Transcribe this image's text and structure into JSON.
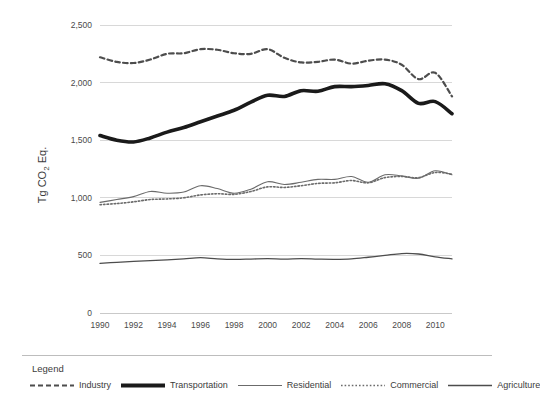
{
  "chart_data": {
    "type": "line",
    "title": "",
    "xlabel": "",
    "ylabel": "Tg CO",
    "ylabel_sub": "2",
    "ylabel_tail": " Eq.",
    "grid": true,
    "legend_position": "bottom",
    "xlim": [
      1990,
      2011
    ],
    "ylim": [
      0,
      2500
    ],
    "yticks": [
      0,
      500,
      1000,
      1500,
      2000,
      2500
    ],
    "ytick_labels": [
      "0",
      "500",
      "1,000",
      "1,500",
      "2,000",
      "2,500"
    ],
    "xticks": [
      1990,
      1992,
      1994,
      1996,
      1998,
      2000,
      2002,
      2004,
      2006,
      2008,
      2010
    ],
    "xtick_labels": [
      "1990",
      "1992",
      "1994",
      "1996",
      "1998",
      "2000",
      "2002",
      "2004",
      "2006",
      "2008",
      "2010"
    ],
    "x": [
      1990,
      1991,
      1992,
      1993,
      1994,
      1995,
      1996,
      1997,
      1998,
      1999,
      2000,
      2001,
      2002,
      2003,
      2004,
      2005,
      2006,
      2007,
      2008,
      2009,
      2010,
      2011
    ],
    "series": [
      {
        "name": "Industry",
        "style": "dashed",
        "color": "#4d4d4d",
        "width": 2.2,
        "values": [
          2220,
          2180,
          2170,
          2200,
          2250,
          2255,
          2290,
          2285,
          2255,
          2250,
          2290,
          2215,
          2175,
          2180,
          2200,
          2165,
          2190,
          2200,
          2155,
          2030,
          2085,
          1880
        ]
      },
      {
        "name": "Transportation",
        "style": "solid",
        "color": "#1a1a1a",
        "width": 3.6,
        "values": [
          1540,
          1500,
          1485,
          1520,
          1570,
          1610,
          1660,
          1710,
          1760,
          1830,
          1890,
          1880,
          1930,
          1925,
          1965,
          1965,
          1975,
          1990,
          1930,
          1820,
          1835,
          1730
        ]
      },
      {
        "name": "Residential",
        "style": "solid",
        "color": "#6b6b6b",
        "width": 1.1,
        "values": [
          960,
          985,
          1010,
          1055,
          1040,
          1050,
          1105,
          1080,
          1040,
          1075,
          1140,
          1115,
          1135,
          1160,
          1160,
          1185,
          1135,
          1200,
          1190,
          1170,
          1235,
          1200
        ]
      },
      {
        "name": "Commercial",
        "style": "dotted",
        "color": "#6b6b6b",
        "width": 1.6,
        "values": [
          940,
          950,
          965,
          985,
          990,
          1000,
          1025,
          1035,
          1030,
          1055,
          1095,
          1090,
          1105,
          1125,
          1130,
          1150,
          1130,
          1175,
          1185,
          1175,
          1220,
          1205
        ]
      },
      {
        "name": "Agriculture",
        "style": "solid",
        "color": "#4d4d4d",
        "width": 1.3,
        "values": [
          430,
          440,
          448,
          455,
          462,
          470,
          480,
          470,
          465,
          468,
          472,
          468,
          472,
          468,
          466,
          470,
          484,
          500,
          516,
          512,
          488,
          470
        ]
      }
    ]
  },
  "legend": {
    "title": "Legend",
    "items": [
      {
        "label": "Industry",
        "style": "dashed"
      },
      {
        "label": "Transportation",
        "style": "thick"
      },
      {
        "label": "Residential",
        "style": "thin"
      },
      {
        "label": "Commercial",
        "style": "dotted"
      },
      {
        "label": "Agriculture",
        "style": "medium"
      }
    ]
  },
  "colors": {
    "grid": "#d8d8d8",
    "axis": "#c9c9c9",
    "text": "#3c3c3c",
    "background": "#ffffff"
  }
}
